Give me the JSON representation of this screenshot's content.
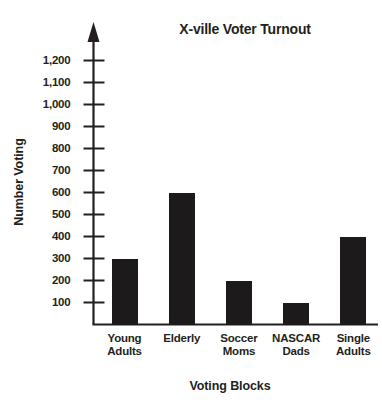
{
  "chart_data": {
    "type": "bar",
    "title": "X-ville Voter Turnout",
    "xlabel": "Voting Blocks",
    "ylabel": "Number Voting",
    "categories": [
      "Young Adults",
      "Elderly",
      "Soccer Moms",
      "NASCAR Dads",
      "Single Adults"
    ],
    "category_lines": [
      [
        "Young",
        "Adults"
      ],
      [
        "Elderly",
        ""
      ],
      [
        "Soccer",
        "Moms"
      ],
      [
        "NASCAR",
        "Dads"
      ],
      [
        "Single",
        "Adults"
      ]
    ],
    "values": [
      300,
      600,
      200,
      100,
      400
    ],
    "ylim": [
      0,
      1250
    ],
    "ytick_values": [
      100,
      200,
      300,
      400,
      500,
      600,
      700,
      800,
      900,
      1000,
      1100,
      1200
    ],
    "ytick_labels": [
      "100",
      "200",
      "300",
      "400",
      "500",
      "600",
      "700",
      "800",
      "900",
      "1,000",
      "1,100",
      "1,200"
    ],
    "grid": false,
    "legend": false,
    "bar_color": "#1c1a1b",
    "axis_color": "#231f20",
    "background_color": "#ffffff",
    "y_axis_arrow": true
  }
}
